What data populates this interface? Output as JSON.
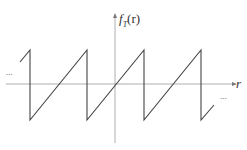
{
  "diagram": {
    "type": "sawtooth_wave",
    "y_axis_label": "f",
    "y_axis_label_sub": "T",
    "y_axis_label_arg": "(r)",
    "x_axis_label": "r",
    "left_ellipsis": "...",
    "right_ellipsis": "...",
    "colors": {
      "axis": "#9a9a9a",
      "wave": "#444444"
    }
  }
}
